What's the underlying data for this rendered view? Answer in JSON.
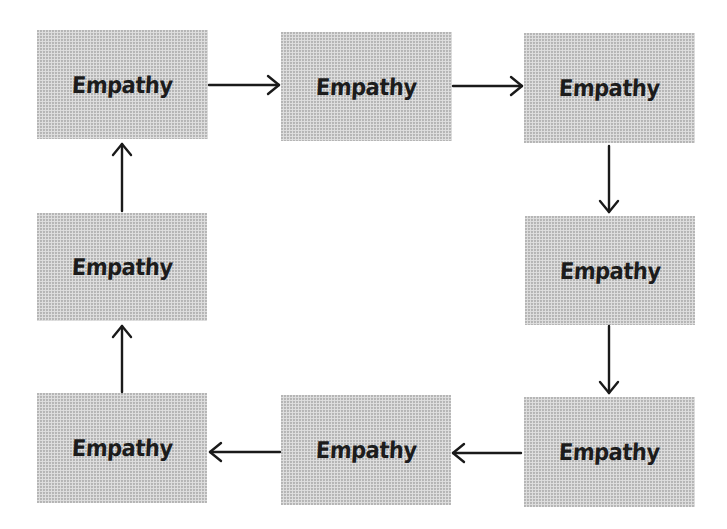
{
  "diagram": {
    "type": "cycle",
    "colors": {
      "box_fill": "#d9d9d9",
      "text": "#1c1c1c",
      "arrow": "#1a1a1a",
      "background": "#ffffff"
    },
    "nodes": [
      {
        "id": "n1",
        "label": "Empathy",
        "position": "top-left"
      },
      {
        "id": "n2",
        "label": "Empathy",
        "position": "top-middle"
      },
      {
        "id": "n3",
        "label": "Empathy",
        "position": "top-right"
      },
      {
        "id": "n4",
        "label": "Empathy",
        "position": "middle-right"
      },
      {
        "id": "n5",
        "label": "Empathy",
        "position": "bottom-right"
      },
      {
        "id": "n6",
        "label": "Empathy",
        "position": "bottom-middle"
      },
      {
        "id": "n7",
        "label": "Empathy",
        "position": "bottom-left"
      },
      {
        "id": "n8",
        "label": "Empathy",
        "position": "middle-left"
      }
    ],
    "edges": [
      {
        "from": "n1",
        "to": "n2",
        "direction": "right"
      },
      {
        "from": "n2",
        "to": "n3",
        "direction": "right"
      },
      {
        "from": "n3",
        "to": "n4",
        "direction": "down"
      },
      {
        "from": "n4",
        "to": "n5",
        "direction": "down"
      },
      {
        "from": "n5",
        "to": "n6",
        "direction": "left"
      },
      {
        "from": "n6",
        "to": "n7",
        "direction": "left"
      },
      {
        "from": "n7",
        "to": "n8",
        "direction": "up"
      },
      {
        "from": "n8",
        "to": "n1",
        "direction": "up"
      }
    ]
  }
}
